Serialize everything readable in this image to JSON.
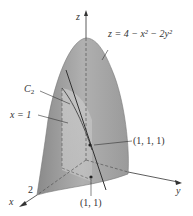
{
  "figure": {
    "type": "3d-surface-diagram",
    "surface_equation": "z = 4 − x² − 2y²",
    "axes": {
      "x": "x",
      "y": "y",
      "z": "z"
    },
    "labels": {
      "equation": "z = 4 − x² − 2y²",
      "curve": "C",
      "curve_sub": "2",
      "plane": "x = 1",
      "point3d": "(1, 1, 1)",
      "point2d": "(1, 1)",
      "x_tick": "2"
    },
    "colors": {
      "surface_dark": "#8c8c8c",
      "surface_light": "#c8c8c8",
      "plane": "#d9d9d9",
      "line": "#444444",
      "axis": "#333333"
    }
  }
}
